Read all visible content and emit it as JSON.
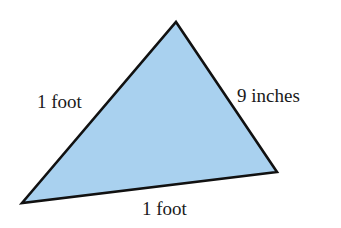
{
  "diagram": {
    "type": "triangle",
    "fill_color": "#a9d1ef",
    "stroke_color": "#111111",
    "vertices": {
      "top": [
        176,
        22
      ],
      "right": [
        277,
        172
      ],
      "bottom_left": [
        22,
        203
      ]
    },
    "labels": {
      "left_side": "1 foot",
      "right_side": "9 inches",
      "bottom_side": "1 foot"
    }
  }
}
